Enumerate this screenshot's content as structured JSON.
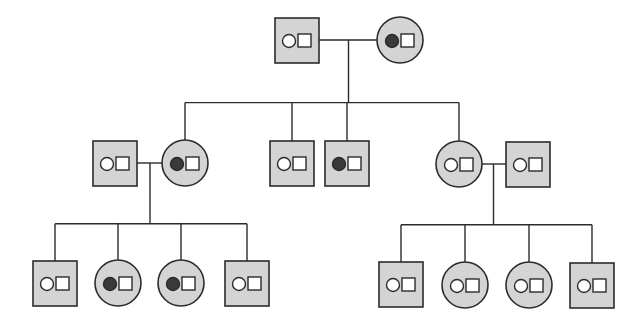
{
  "diagram": {
    "type": "pedigree",
    "title": "",
    "colors": {
      "symbol_fill": "#d4d4d4",
      "stroke": "#2b2b2b",
      "normal_x": "#ffffff",
      "carrier_x": "#3a3a3a",
      "background": "#ffffff"
    },
    "legend_note": "Each symbol contains two sex chromosomes: a circle (X) and a square (Y in males / second X slot). A dark filled circle marks an affected X chromosome.",
    "generations": [
      {
        "id": "I",
        "members": [
          {
            "id": "I-1",
            "sex": "male",
            "x_affected": false,
            "shape": "square",
            "cx": 297,
            "cy": 40
          },
          {
            "id": "I-2",
            "sex": "female",
            "x_affected": true,
            "shape": "circle",
            "cx": 400,
            "cy": 40
          }
        ]
      },
      {
        "id": "II",
        "members": [
          {
            "id": "II-1",
            "sex": "male",
            "x_affected": false,
            "shape": "square",
            "cx": 115,
            "cy": 163,
            "note": "spouse (married in)"
          },
          {
            "id": "II-2",
            "sex": "female",
            "x_affected": true,
            "shape": "circle",
            "cx": 185,
            "cy": 163
          },
          {
            "id": "II-3",
            "sex": "male",
            "x_affected": false,
            "shape": "square",
            "cx": 292,
            "cy": 163
          },
          {
            "id": "II-4",
            "sex": "male",
            "x_affected": true,
            "shape": "square",
            "cx": 347,
            "cy": 163
          },
          {
            "id": "II-5",
            "sex": "female",
            "x_affected": false,
            "shape": "circle",
            "cx": 459,
            "cy": 164
          },
          {
            "id": "II-6",
            "sex": "male",
            "x_affected": false,
            "shape": "square",
            "cx": 528,
            "cy": 164,
            "note": "spouse (married in)"
          }
        ]
      },
      {
        "id": "III",
        "members": [
          {
            "id": "III-1",
            "sex": "male",
            "x_affected": false,
            "shape": "square",
            "cx": 55,
            "cy": 283
          },
          {
            "id": "III-2",
            "sex": "female",
            "x_affected": true,
            "shape": "circle",
            "cx": 118,
            "cy": 283
          },
          {
            "id": "III-3",
            "sex": "female",
            "x_affected": true,
            "shape": "circle",
            "cx": 181,
            "cy": 283
          },
          {
            "id": "III-4",
            "sex": "male",
            "x_affected": false,
            "shape": "square",
            "cx": 247,
            "cy": 283
          },
          {
            "id": "III-5",
            "sex": "male",
            "x_affected": false,
            "shape": "square",
            "cx": 401,
            "cy": 284
          },
          {
            "id": "III-6",
            "sex": "female",
            "x_affected": false,
            "shape": "circle",
            "cx": 465,
            "cy": 285
          },
          {
            "id": "III-7",
            "sex": "female",
            "x_affected": false,
            "shape": "circle",
            "cx": 529,
            "cy": 285
          },
          {
            "id": "III-8",
            "sex": "male",
            "x_affected": false,
            "shape": "square",
            "cx": 592,
            "cy": 285
          }
        ]
      }
    ],
    "relationships": [
      {
        "type": "mating",
        "partners": [
          "I-1",
          "I-2"
        ],
        "children": [
          "II-2",
          "II-3",
          "II-4",
          "II-5"
        ]
      },
      {
        "type": "mating",
        "partners": [
          "II-1",
          "II-2"
        ],
        "children": [
          "III-1",
          "III-2",
          "III-3",
          "III-4"
        ]
      },
      {
        "type": "mating",
        "partners": [
          "II-5",
          "II-6"
        ],
        "children": [
          "III-5",
          "III-6",
          "III-7",
          "III-8"
        ]
      }
    ]
  }
}
